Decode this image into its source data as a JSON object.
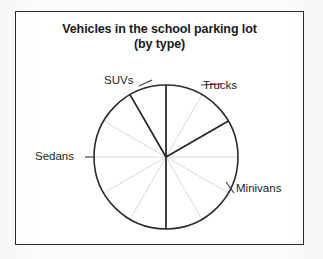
{
  "figure": {
    "title_line1": "Vehicles in the school parking lot",
    "title_line2": "(by type)"
  },
  "labels": {
    "suvs": "SUVs",
    "trucks": "Trucks",
    "sedans": "Sedans",
    "minivans": "Minivans"
  },
  "colors": {
    "frame": "#2b2b2b",
    "outline": "#2b2b2b",
    "sector_divider": "#242424",
    "gridline": "#d9d9d9",
    "text": "#1a1a1a",
    "background": "#ffffff",
    "page": "#fbfbfb"
  },
  "chart_data": {
    "type": "pie",
    "title": "Vehicles in the school parking lot (by type)",
    "unit": "twelfths of circle (each gridline wedge = 30°)",
    "total_wedges": 12,
    "wedge_degrees": 30,
    "start_angle_deg": 0,
    "direction": "clockwise from 12 o'clock",
    "grid": true,
    "gridlines_deg": [
      0,
      30,
      60,
      90,
      120,
      150,
      180,
      210,
      240,
      270,
      300,
      330
    ],
    "legend": "none (slices labeled directly)",
    "categories": [
      "Trucks",
      "Minivans",
      "Sedans",
      "SUVs"
    ],
    "values": [
      2,
      4,
      5,
      1
    ],
    "slices": [
      {
        "label": "Trucks",
        "wedges": 2,
        "degrees": 60,
        "fraction": 0.1667,
        "percent": 16.7,
        "start_deg": 0,
        "end_deg": 60,
        "clock_span": "12 o'clock to 2 o'clock"
      },
      {
        "label": "Minivans",
        "wedges": 4,
        "degrees": 120,
        "fraction": 0.3333,
        "percent": 33.3,
        "start_deg": 60,
        "end_deg": 180,
        "clock_span": "2 o'clock to 6 o'clock"
      },
      {
        "label": "Sedans",
        "wedges": 5,
        "degrees": 150,
        "fraction": 0.4167,
        "percent": 41.7,
        "start_deg": 180,
        "end_deg": 330,
        "clock_span": "6 o'clock to 11 o'clock"
      },
      {
        "label": "SUVs",
        "wedges": 1,
        "degrees": 30,
        "fraction": 0.0833,
        "percent": 8.3,
        "start_deg": 330,
        "end_deg": 360,
        "clock_span": "11 o'clock to 12 o'clock"
      }
    ],
    "geometry": {
      "center_x": 166,
      "center_y": 157,
      "radius": 72
    }
  }
}
